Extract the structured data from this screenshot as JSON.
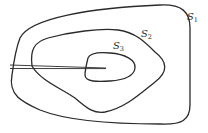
{
  "diagram": {
    "type": "nested closed curves with cut",
    "curves": [
      {
        "id": "S1",
        "label": "S",
        "subscript": "1",
        "role": "outer curve"
      },
      {
        "id": "S2",
        "label": "S",
        "subscript": "2",
        "role": "middle curve"
      },
      {
        "id": "S3",
        "label": "S",
        "subscript": "3",
        "role": "inner curve"
      }
    ],
    "cut": {
      "description": "double line (narrow slit) from left edge through S1 and S2 into S3"
    },
    "colors": {
      "stroke": "#2a2a2a",
      "background": "#ffffff"
    }
  }
}
